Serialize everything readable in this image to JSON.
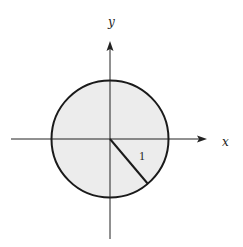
{
  "diagram": {
    "axes": {
      "x_label": "x",
      "y_label": "y"
    },
    "circle": {
      "radius_label": "1",
      "fill_color": "#ececec",
      "stroke_color": "#1a1a1a"
    },
    "colors": {
      "axis": "#222222",
      "background": "#ffffff"
    }
  }
}
